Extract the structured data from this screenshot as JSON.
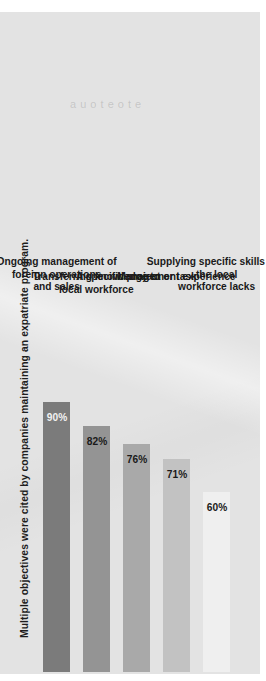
{
  "chart_data": {
    "type": "bar",
    "title": "Multiple objectives were cited by companies maintaining an expatriate program.",
    "xlabel": "",
    "ylabel": "",
    "ylim": [
      0,
      100
    ],
    "grid": false,
    "legend": "none",
    "orientation": "vertical-rotated",
    "categories": [
      "Ongoing management of foreign operations\nand sales",
      "Transferring knowledge to local workforce",
      "A specific project or task",
      "Management experience",
      "Supplying specific skills that the local\nworkforce lacks"
    ],
    "values": [
      90,
      82,
      76,
      71,
      60
    ],
    "value_labels": [
      "90%",
      "82%",
      "76%",
      "71%",
      "60%"
    ],
    "bar_colors": [
      "#7b7b7b",
      "#949494",
      "#a9a9a9",
      "#c2c2c2",
      "#eeeeee"
    ],
    "value_label_colors": [
      "#f2f2f2",
      "#1a1a1a",
      "#1a1a1a",
      "#1a1a1a",
      "#1a1a1a"
    ]
  },
  "page": {
    "background_color": "#ffffff",
    "paper_color": "#e3e3e3",
    "ghost_text": "a u o   t e   o t e",
    "artifact_mark": ""
  }
}
